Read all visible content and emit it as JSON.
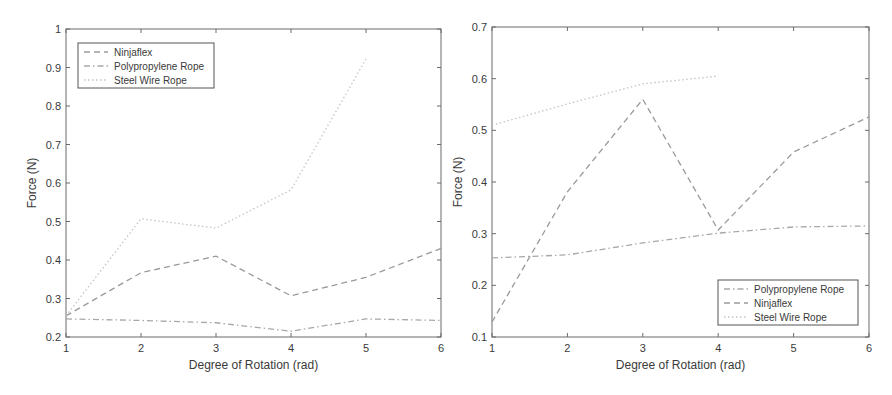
{
  "chart_data": [
    {
      "type": "line",
      "title": "",
      "xlabel": "Degree of Rotation (rad)",
      "ylabel": "Force (N)",
      "xlim": [
        1,
        6
      ],
      "ylim": [
        0.2,
        1
      ],
      "xticks": [
        1,
        2,
        3,
        4,
        5,
        6
      ],
      "yticks": [
        0.2,
        0.3,
        0.4,
        0.5,
        0.6,
        0.7,
        0.8,
        0.9,
        1
      ],
      "ytick_labels": [
        "0.2",
        "0.3",
        "0.4",
        "0.5",
        "0.6",
        "0.7",
        "0.8",
        "0.9",
        "1"
      ],
      "grid": false,
      "legend_position": "upper left",
      "series": [
        {
          "name": "Ninjaflex",
          "style": "dashed",
          "color": "#9a9a9a",
          "x": [
            1,
            2,
            3,
            4,
            5,
            6
          ],
          "values": [
            0.255,
            0.367,
            0.41,
            0.307,
            0.355,
            0.43
          ]
        },
        {
          "name": "Polypropylene Rope",
          "style": "dashdot",
          "color": "#a8a8a8",
          "x": [
            1,
            2,
            3,
            4,
            5,
            6
          ],
          "values": [
            0.247,
            0.243,
            0.237,
            0.215,
            0.247,
            0.243
          ]
        },
        {
          "name": "Steel Wire Rope",
          "style": "dotted",
          "color": "#c4c4c4",
          "x": [
            1,
            2,
            3,
            4,
            5
          ],
          "values": [
            0.255,
            0.507,
            0.483,
            0.582,
            0.922
          ]
        }
      ]
    },
    {
      "type": "line",
      "title": "",
      "xlabel": "Degree of Rotation (rad)",
      "ylabel": "Force (N)",
      "xlim": [
        1,
        6
      ],
      "ylim": [
        0.1,
        0.7
      ],
      "xticks": [
        1,
        2,
        3,
        4,
        5,
        6
      ],
      "yticks": [
        0.1,
        0.2,
        0.3,
        0.4,
        0.5,
        0.6,
        0.7
      ],
      "ytick_labels": [
        "0.1",
        "0.2",
        "0.3",
        "0.4",
        "0.5",
        "0.6",
        "0.7"
      ],
      "grid": false,
      "legend_position": "lower right",
      "series": [
        {
          "name": "Polypropylene Rope",
          "style": "dashdot",
          "color": "#a8a8a8",
          "x": [
            1,
            2,
            3,
            4,
            5,
            6
          ],
          "values": [
            0.253,
            0.259,
            0.282,
            0.301,
            0.313,
            0.315
          ]
        },
        {
          "name": "Ninjaflex",
          "style": "dashed",
          "color": "#9a9a9a",
          "x": [
            1,
            2,
            3,
            4,
            5,
            6
          ],
          "values": [
            0.129,
            0.381,
            0.56,
            0.307,
            0.458,
            0.526
          ]
        },
        {
          "name": "Steel Wire Rope",
          "style": "dotted",
          "color": "#c4c4c4",
          "x": [
            1,
            2,
            3,
            4
          ],
          "values": [
            0.51,
            0.551,
            0.59,
            0.605
          ]
        }
      ]
    }
  ],
  "layout": [
    {
      "plot": {
        "left": 66,
        "top": 29,
        "right": 441,
        "bottom": 337
      },
      "legend": {
        "x": 78,
        "y": 43,
        "w": 136,
        "h": 45
      }
    },
    {
      "plot": {
        "left": 46,
        "top": 27,
        "right": 423,
        "bottom": 337
      },
      "legend": {
        "x": 272,
        "y": 280,
        "w": 140,
        "h": 45
      }
    }
  ]
}
